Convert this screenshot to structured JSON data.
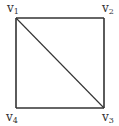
{
  "diagram": {
    "type": "graph",
    "colors": {
      "stroke": "#333333",
      "background": "#ffffff",
      "label": "#333333"
    },
    "vertices": [
      {
        "id": "v1",
        "base": "v",
        "sub": "1",
        "x": 16,
        "y": 18
      },
      {
        "id": "v2",
        "base": "v",
        "sub": "2",
        "x": 104,
        "y": 18
      },
      {
        "id": "v3",
        "base": "v",
        "sub": "3",
        "x": 104,
        "y": 108
      },
      {
        "id": "v4",
        "base": "v",
        "sub": "4",
        "x": 16,
        "y": 108
      }
    ],
    "edges": [
      {
        "from": "v1",
        "to": "v2"
      },
      {
        "from": "v2",
        "to": "v3"
      },
      {
        "from": "v3",
        "to": "v4"
      },
      {
        "from": "v4",
        "to": "v1"
      },
      {
        "from": "v1",
        "to": "v3"
      }
    ]
  }
}
